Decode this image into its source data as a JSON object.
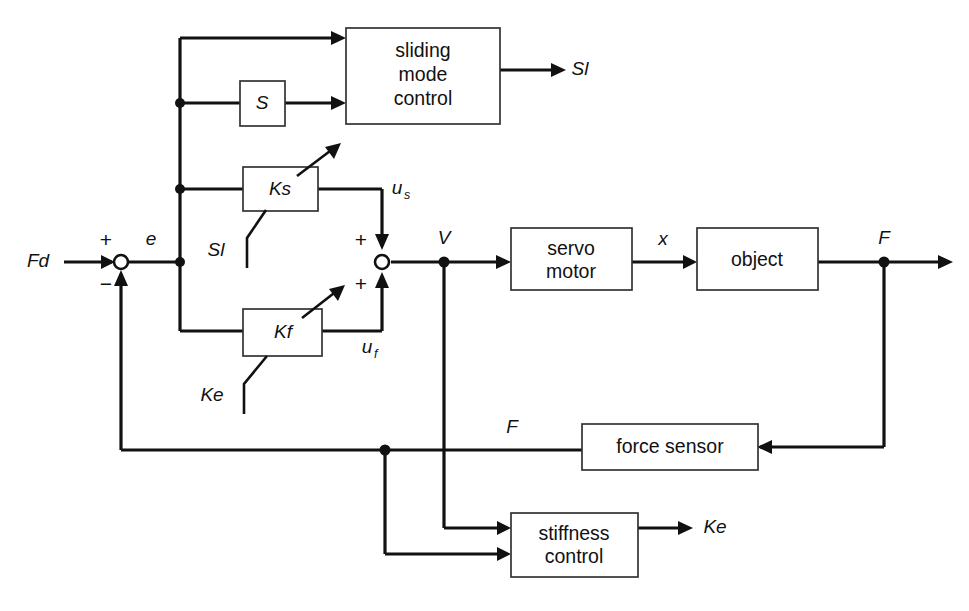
{
  "diagram": {
    "background_color": "#ffffff",
    "line_color": "#111111",
    "blocks": [
      {
        "id": "sliding-mode-control",
        "line1": "sliding",
        "line2": "mode",
        "line3": "control"
      },
      {
        "id": "switching-function",
        "label": "S"
      },
      {
        "id": "gain-ks",
        "label": "Ks"
      },
      {
        "id": "gain-kf",
        "label": "Kf"
      },
      {
        "id": "servo-motor",
        "line1": "servo",
        "line2": "motor"
      },
      {
        "id": "object",
        "label": "object"
      },
      {
        "id": "force-sensor",
        "label": "force sensor"
      },
      {
        "id": "stiffness-control",
        "line1": "stiffness",
        "line2": "control"
      }
    ],
    "signals": {
      "desired_force": "Fd",
      "error": "e",
      "plus_sign": "+",
      "minus_sign": "−",
      "sliding_output": "Sl",
      "u_s_base": "u",
      "u_s_sub": "s",
      "u_f_base": "u",
      "u_f_sub": "f",
      "velocity": "V",
      "displacement": "x",
      "force": "F",
      "force_feedback": "F",
      "switch_sl": "Sl",
      "switch_ke": "Ke",
      "stiffness_out": "Ke",
      "sum2_plus_top": "+",
      "sum2_plus_bottom": "+"
    }
  }
}
